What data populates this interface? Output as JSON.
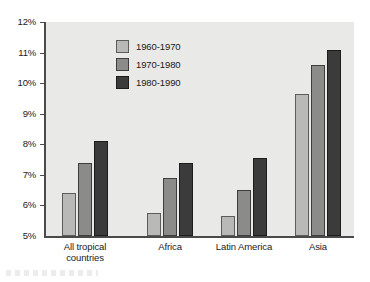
{
  "chart_data": {
    "type": "bar",
    "title": "",
    "subtitle": "",
    "xlabel": "",
    "ylabel": "",
    "categories": [
      "All tropical\ncountries",
      "Africa",
      "Latin America",
      "Asia"
    ],
    "series": [
      {
        "name": "1960-1970",
        "color": "#b9b9b7",
        "values": [
          6.4,
          5.75,
          5.65,
          9.65
        ]
      },
      {
        "name": "1970-1980",
        "color": "#8b8b89",
        "values": [
          7.4,
          6.9,
          6.5,
          10.6
        ]
      },
      {
        "name": "1980-1990",
        "color": "#3b3b3b",
        "values": [
          8.1,
          7.4,
          7.55,
          11.1
        ]
      }
    ],
    "ylim": [
      5,
      12
    ],
    "ytick_values": [
      5,
      6,
      7,
      8,
      9,
      10,
      11,
      12
    ],
    "ytick_labels": [
      "5%",
      "6%",
      "7%",
      "8%",
      "9%",
      "10%",
      "11%",
      "12%"
    ],
    "grid": false,
    "legend_position": "upper-left-inside",
    "value_suffix": "%"
  },
  "legend": {
    "entries": [
      {
        "label": "1960-1970"
      },
      {
        "label": "1970-1980"
      },
      {
        "label": "1980-1990"
      }
    ]
  }
}
